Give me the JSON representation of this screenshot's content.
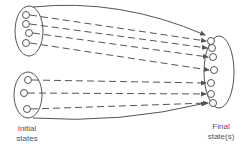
{
  "diagram": {
    "labels": {
      "initial_line1": "Initial",
      "initial_line2": "states",
      "final_line1": "Final",
      "final_line2": "state(s)"
    },
    "colors": {
      "stroke": "#555555",
      "background": "#ffffff"
    },
    "groups": {
      "initial_top": {
        "ellipse": {
          "cx": 29,
          "cy": 31,
          "rx": 14,
          "ry": 25
        },
        "states": [
          [
            26,
            15
          ],
          [
            26,
            24
          ],
          [
            29,
            33
          ],
          [
            26,
            43
          ]
        ]
      },
      "initial_bottom": {
        "ellipse": {
          "cx": 28,
          "cy": 95,
          "rx": 14,
          "ry": 23
        },
        "states": [
          [
            28,
            80
          ],
          [
            24,
            93
          ],
          [
            27,
            109
          ]
        ]
      },
      "final": {
        "ellipse": {
          "cx": 219,
          "cy": 72,
          "rx": 15,
          "ry": 36
        },
        "states": [
          [
            211,
            41
          ],
          [
            212,
            48
          ],
          [
            213,
            57
          ],
          [
            214,
            70
          ],
          [
            211,
            83
          ],
          [
            211,
            94
          ],
          [
            213,
            103
          ]
        ]
      }
    },
    "transitions": "dashed arrows from each initial state to a final state; solid curved arrows bound each initial group"
  }
}
